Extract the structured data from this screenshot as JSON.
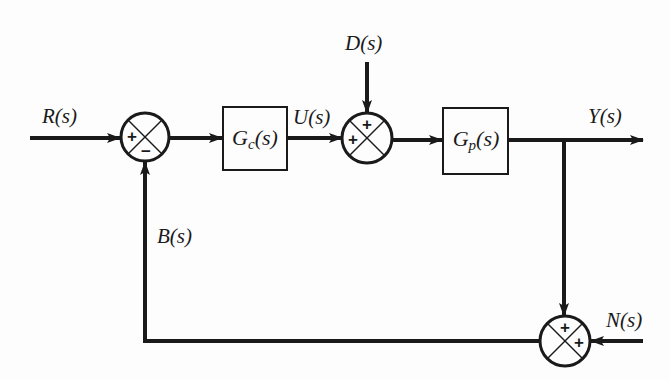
{
  "diagram": {
    "type": "control-system-block-diagram",
    "signals": {
      "reference": "R(s)",
      "control": "U(s)",
      "disturbance": "D(s)",
      "output": "Y(s)",
      "feedback": "B(s)",
      "noise": "N(s)"
    },
    "blocks": {
      "controller": {
        "name": "G",
        "sub": "c",
        "arg": "(s)"
      },
      "plant": {
        "name": "G",
        "sub": "p",
        "arg": "(s)"
      }
    },
    "junctions": {
      "error_sum": {
        "signs": [
          "+",
          "−"
        ]
      },
      "disturbance_sum": {
        "signs": [
          "+",
          "+"
        ]
      },
      "noise_sum": {
        "signs": [
          "+",
          "+"
        ]
      }
    },
    "colors": {
      "stroke": "#1a1a1a",
      "background": "#fdfdfd"
    }
  }
}
